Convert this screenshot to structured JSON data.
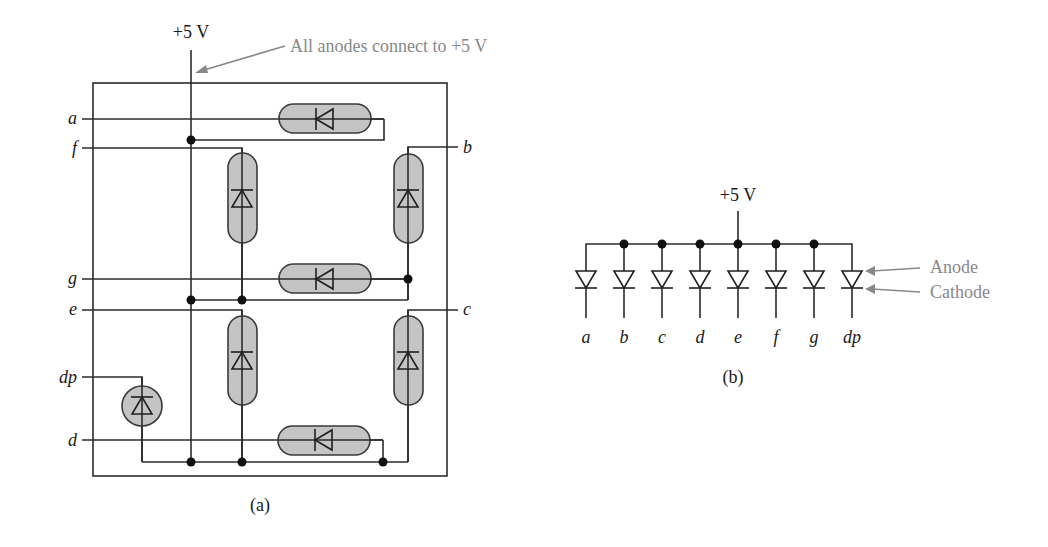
{
  "figure_a": {
    "supply_label": "+5 V",
    "annotation": "All anodes connect to +5 V",
    "caption": "(a)",
    "segment_labels": {
      "a": "a",
      "b": "b",
      "c": "c",
      "d": "d",
      "e": "e",
      "f": "f",
      "g": "g",
      "dp": "dp"
    }
  },
  "figure_b": {
    "supply_label": "+5 V",
    "caption": "(b)",
    "diode_labels": [
      "a",
      "b",
      "c",
      "d",
      "e",
      "f",
      "g",
      "dp"
    ],
    "anode_label": "Anode",
    "cathode_label": "Cathode"
  },
  "colors": {
    "wire": "#2b2b2b",
    "segment_fill": "#c4c4c4",
    "annotation": "#888888"
  }
}
